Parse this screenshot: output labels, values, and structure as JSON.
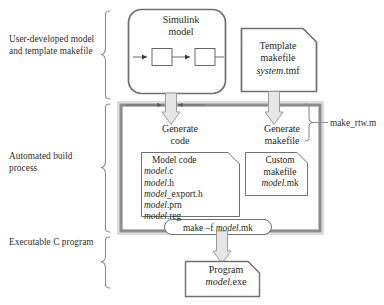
{
  "diagram": {
    "colors": {
      "text": "#262626",
      "thick_border": "#8d8d8d",
      "thin_border": "#6e6e6e",
      "arrow_fill": "#e2e2e2",
      "arrow_stroke": "#9a9a9a",
      "brace": "#8a8a8a",
      "background": "#ffffff"
    }
  },
  "side_labels": {
    "user": "User-developed model and template makefile",
    "build": "Automated build process",
    "exec": "Executable C program"
  },
  "right_label": {
    "make_rtw": "make_rtw.m"
  },
  "nodes": {
    "simulink_model": {
      "line1": "Simulink",
      "line2": "model",
      "shape": "rounded-rect",
      "inner_blocks": 2
    },
    "template_makefile": {
      "line1": "Template",
      "line2": "makefile",
      "file_italic": "system",
      "file_ext": ".tmf",
      "shape": "document"
    },
    "generate_code": {
      "line1": "Generate",
      "line2": "code"
    },
    "generate_makefile": {
      "line1": "Generate",
      "line2": "makefile"
    },
    "model_code": {
      "header": "Model code",
      "files": [
        {
          "stem": "model",
          "ext": ".c"
        },
        {
          "stem": "model",
          "ext": ".h"
        },
        {
          "stem": "model",
          "ext": "_export.h"
        },
        {
          "stem": "model",
          "ext": ".prn"
        },
        {
          "stem": "model",
          "ext": ".reg"
        }
      ],
      "shape": "document"
    },
    "custom_makefile": {
      "line1": "Custom",
      "line2": "makefile",
      "file_italic": "model",
      "file_ext": ".mk",
      "shape": "document"
    },
    "make_command": {
      "prefix": "make –f ",
      "italic": "model",
      "suffix": ".mk",
      "shape": "stadium"
    },
    "program": {
      "line1": "Program",
      "file_italic": "model",
      "file_ext": ".exe",
      "shape": "document"
    }
  },
  "icons": {
    "down_arrow_code": "down-arrow-icon",
    "down_arrow_makefile": "down-arrow-icon",
    "down_arrow_program": "down-arrow-icon",
    "brace_user": "curly-brace-icon",
    "brace_build": "curly-brace-icon",
    "brace_exec": "curly-brace-icon",
    "brace_makertw": "curly-brace-icon"
  }
}
